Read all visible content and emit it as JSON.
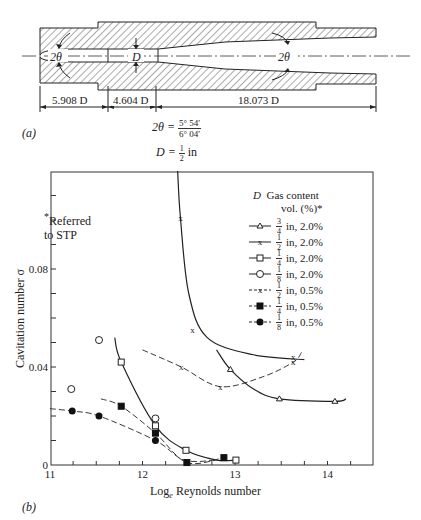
{
  "part_a": {
    "label": "(a)",
    "dimensions": [
      "5.908 D",
      "4.604 D",
      "18.073 D"
    ],
    "angle_label_left": "2θ",
    "angle_label_right": "2θ",
    "throat_label": "D",
    "formula_theta_lhs": "2θ =",
    "formula_theta_num": "5° 54′",
    "formula_theta_den": "6° 04′",
    "formula_d_lhs": "D =",
    "formula_d_num": "1",
    "formula_d_den": "2",
    "formula_d_unit": "in"
  },
  "part_b": {
    "label": "(b)",
    "note_line1": "Referred",
    "note_line2": "to STP",
    "note_star": "*",
    "legend_header_d": "D",
    "legend_header_gas": "Gas content",
    "legend_header_vol": "vol. (%)*"
  },
  "chart_data": {
    "type": "scatter",
    "title": "",
    "xlabel": "Log_e Reynolds number",
    "ylabel": "Cavitation number σ",
    "xlim": [
      11,
      14.5
    ],
    "ylim": [
      0,
      0.12
    ],
    "xticks": [
      11,
      12,
      13,
      14
    ],
    "yticks": [
      0,
      0.04,
      0.08
    ],
    "grid": false,
    "legend_position": "upper right",
    "series": [
      {
        "name": "3/4 in, 2.0%",
        "d_num": "3",
        "d_den": "4",
        "rest": "in, 2.0%",
        "marker": "triangle-open",
        "line": "solid",
        "x": [
          12.95,
          13.48,
          14.08
        ],
        "y": [
          0.039,
          0.027,
          0.026
        ]
      },
      {
        "name": "1/2 in, 2.0%",
        "d_num": "1",
        "d_den": "2",
        "rest": "in, 2.0%",
        "marker": "x",
        "line": "solid",
        "x": [
          12.41,
          12.54,
          13.63
        ],
        "y": [
          0.101,
          0.055,
          0.044
        ]
      },
      {
        "name": "1/4 in, 2.0%",
        "d_num": "1",
        "d_den": "4",
        "rest": "in, 2.0%",
        "marker": "square-open",
        "line": "solid",
        "x": [
          11.77,
          12.14,
          12.47,
          13.01
        ],
        "y": [
          0.042,
          0.016,
          0.006,
          0.002
        ]
      },
      {
        "name": "1/8 in, 2.0%",
        "d_num": "1",
        "d_den": "8",
        "rest": "in, 2.0%",
        "marker": "circle-open",
        "line": "solid",
        "x": [
          11.23,
          11.53,
          12.14
        ],
        "y": [
          0.031,
          0.051,
          0.019
        ]
      },
      {
        "name": "1/2 in, 0.5%",
        "d_num": "1",
        "d_den": "2",
        "rest": "in, 0.5%",
        "marker": "x",
        "line": "dashed",
        "x": [
          12.42,
          12.84,
          13.63
        ],
        "y": [
          0.04,
          0.032,
          0.042
        ]
      },
      {
        "name": "1/4 in, 0.5%",
        "d_num": "1",
        "d_den": "4",
        "rest": "in, 0.5%",
        "marker": "square-filled",
        "line": "dashed",
        "x": [
          11.77,
          12.14,
          12.48,
          12.88
        ],
        "y": [
          0.024,
          0.013,
          0.001,
          0.003
        ]
      },
      {
        "name": "1/8 in, 0.5%",
        "d_num": "1",
        "d_den": "8",
        "rest": "in, 0.5%",
        "marker": "circle-filled",
        "line": "dashed",
        "x": [
          11.24,
          11.53,
          12.14
        ],
        "y": [
          0.022,
          0.02,
          0.01
        ]
      }
    ],
    "annotations": [
      "*Referred to STP"
    ]
  }
}
